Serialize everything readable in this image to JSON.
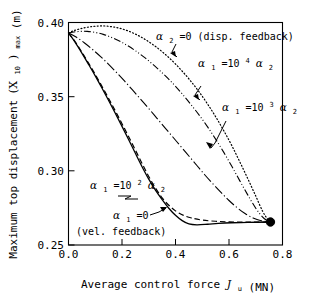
{
  "chart_data": {
    "type": "line",
    "title": "",
    "xlabel": "Average control force J_u (MN)",
    "ylabel": "Maximum top displacement  (X10)max  (m)",
    "xlim": [
      0.0,
      0.8
    ],
    "ylim": [
      0.25,
      0.4
    ],
    "xticks": [
      "0.0",
      "0.2",
      "0.4",
      "0.6",
      "0.8"
    ],
    "xtick_values": [
      0.0,
      0.2,
      0.4,
      0.6,
      0.8
    ],
    "yticks": [
      "0.25",
      "0.30",
      "0.35",
      "0.40"
    ],
    "ytick_values": [
      0.25,
      0.3,
      0.35,
      0.4
    ],
    "grid": false,
    "legend_position": "inline-annotations",
    "marker_endpoint": {
      "x": 0.755,
      "y": 0.2655,
      "style": "filled-circle"
    },
    "series": [
      {
        "name": "a2=0 (disp. feedback)",
        "style": "dotted",
        "points": [
          [
            0.0,
            0.393
          ],
          [
            0.02,
            0.3945
          ],
          [
            0.045,
            0.3958
          ],
          [
            0.07,
            0.3968
          ],
          [
            0.1,
            0.3975
          ],
          [
            0.13,
            0.3977
          ],
          [
            0.16,
            0.3972
          ],
          [
            0.19,
            0.3962
          ],
          [
            0.22,
            0.3945
          ],
          [
            0.25,
            0.3922
          ],
          [
            0.28,
            0.3893
          ],
          [
            0.31,
            0.3858
          ],
          [
            0.34,
            0.3818
          ],
          [
            0.37,
            0.3772
          ],
          [
            0.4,
            0.372
          ],
          [
            0.43,
            0.3662
          ],
          [
            0.46,
            0.3598
          ],
          [
            0.49,
            0.3528
          ],
          [
            0.52,
            0.345
          ],
          [
            0.55,
            0.3365
          ],
          [
            0.58,
            0.3272
          ],
          [
            0.61,
            0.3172
          ],
          [
            0.64,
            0.3062
          ],
          [
            0.67,
            0.2948
          ],
          [
            0.7,
            0.283
          ],
          [
            0.725,
            0.273
          ],
          [
            0.742,
            0.268
          ],
          [
            0.755,
            0.2655
          ]
        ]
      },
      {
        "name": "a1=10^4 a2",
        "style": "dash-dot-dot",
        "points": [
          [
            0.0,
            0.393
          ],
          [
            0.02,
            0.3936
          ],
          [
            0.045,
            0.394
          ],
          [
            0.07,
            0.394
          ],
          [
            0.1,
            0.3933
          ],
          [
            0.13,
            0.392
          ],
          [
            0.16,
            0.39
          ],
          [
            0.19,
            0.3875
          ],
          [
            0.22,
            0.3845
          ],
          [
            0.25,
            0.381
          ],
          [
            0.28,
            0.377
          ],
          [
            0.31,
            0.3726
          ],
          [
            0.34,
            0.3678
          ],
          [
            0.37,
            0.3626
          ],
          [
            0.4,
            0.357
          ],
          [
            0.43,
            0.3508
          ],
          [
            0.46,
            0.3442
          ],
          [
            0.49,
            0.3372
          ],
          [
            0.52,
            0.3296
          ],
          [
            0.55,
            0.3214
          ],
          [
            0.58,
            0.3126
          ],
          [
            0.61,
            0.3032
          ],
          [
            0.64,
            0.2934
          ],
          [
            0.67,
            0.2838
          ],
          [
            0.7,
            0.2748
          ],
          [
            0.725,
            0.269
          ],
          [
            0.742,
            0.2665
          ],
          [
            0.755,
            0.2655
          ]
        ]
      },
      {
        "name": "a1=10^3 a2",
        "style": "long-dash-dot",
        "points": [
          [
            0.0,
            0.393
          ],
          [
            0.03,
            0.39
          ],
          [
            0.06,
            0.3862
          ],
          [
            0.09,
            0.3818
          ],
          [
            0.12,
            0.377
          ],
          [
            0.15,
            0.3718
          ],
          [
            0.18,
            0.3662
          ],
          [
            0.21,
            0.3604
          ],
          [
            0.24,
            0.3544
          ],
          [
            0.27,
            0.3482
          ],
          [
            0.3,
            0.342
          ],
          [
            0.33,
            0.3356
          ],
          [
            0.36,
            0.3292
          ],
          [
            0.39,
            0.3228
          ],
          [
            0.42,
            0.3164
          ],
          [
            0.45,
            0.31
          ],
          [
            0.48,
            0.3036
          ],
          [
            0.51,
            0.2972
          ],
          [
            0.54,
            0.2912
          ],
          [
            0.57,
            0.2855
          ],
          [
            0.6,
            0.28
          ],
          [
            0.63,
            0.2752
          ],
          [
            0.66,
            0.2712
          ],
          [
            0.69,
            0.2682
          ],
          [
            0.72,
            0.2664
          ],
          [
            0.755,
            0.2655
          ]
        ]
      },
      {
        "name": "a1=10^2 a2",
        "style": "dashed",
        "points": [
          [
            0.0,
            0.393
          ],
          [
            0.025,
            0.387
          ],
          [
            0.05,
            0.38
          ],
          [
            0.075,
            0.3726
          ],
          [
            0.1,
            0.365
          ],
          [
            0.125,
            0.357
          ],
          [
            0.15,
            0.3488
          ],
          [
            0.175,
            0.3404
          ],
          [
            0.2,
            0.3318
          ],
          [
            0.225,
            0.323
          ],
          [
            0.25,
            0.314
          ],
          [
            0.275,
            0.305
          ],
          [
            0.3,
            0.2962
          ],
          [
            0.325,
            0.2884
          ],
          [
            0.35,
            0.2818
          ],
          [
            0.375,
            0.2768
          ],
          [
            0.4,
            0.273
          ],
          [
            0.43,
            0.27
          ],
          [
            0.46,
            0.2682
          ],
          [
            0.5,
            0.2668
          ],
          [
            0.55,
            0.266
          ],
          [
            0.6,
            0.2656
          ],
          [
            0.65,
            0.2654
          ],
          [
            0.7,
            0.2654
          ],
          [
            0.755,
            0.2655
          ]
        ]
      },
      {
        "name": "a1=0 (vel. feedback)",
        "style": "solid",
        "points": [
          [
            0.0,
            0.393
          ],
          [
            0.025,
            0.3866
          ],
          [
            0.05,
            0.3794
          ],
          [
            0.075,
            0.3718
          ],
          [
            0.1,
            0.364
          ],
          [
            0.125,
            0.3558
          ],
          [
            0.15,
            0.3474
          ],
          [
            0.175,
            0.3388
          ],
          [
            0.2,
            0.33
          ],
          [
            0.225,
            0.321
          ],
          [
            0.25,
            0.3118
          ],
          [
            0.275,
            0.3028
          ],
          [
            0.3,
            0.2944
          ],
          [
            0.325,
            0.287
          ],
          [
            0.35,
            0.2806
          ],
          [
            0.375,
            0.2748
          ],
          [
            0.4,
            0.27
          ],
          [
            0.425,
            0.2664
          ],
          [
            0.45,
            0.2642
          ],
          [
            0.48,
            0.2636
          ],
          [
            0.52,
            0.264
          ],
          [
            0.56,
            0.2646
          ],
          [
            0.61,
            0.265
          ],
          [
            0.67,
            0.2652
          ],
          [
            0.755,
            0.2655
          ]
        ]
      }
    ],
    "annotations": [
      {
        "id": "ann-a2-zero",
        "text": "a2=0 (disp. feedback)"
      },
      {
        "id": "ann-a1-10e4",
        "text": "a1=10^4 a2"
      },
      {
        "id": "ann-a1-10e3",
        "text": "a1=10^3 a2"
      },
      {
        "id": "ann-a1-10e2",
        "text": "a1=10^2 a2"
      },
      {
        "id": "ann-a1-zero",
        "text": "a1=0"
      },
      {
        "id": "ann-vel-fb",
        "text": "(vel. feedback)"
      }
    ]
  },
  "axes": {
    "x_title_main": "Average control force",
    "x_title_symbol": "J",
    "x_title_symbol_sub": "u",
    "x_title_unit": "(MN)",
    "y_title_main": "Maximum top displacement",
    "y_title_symbol_open": "(X",
    "y_title_symbol_sub": "10",
    "y_title_symbol_close": ")",
    "y_title_symbol_sub2": "max",
    "y_title_unit": "(m)"
  },
  "labels": {
    "x0": "0.0",
    "x1": "0.2",
    "x2": "0.4",
    "x3": "0.6",
    "x4": "0.8",
    "y0": "0.25",
    "y1": "0.30",
    "y2": "0.35",
    "y3": "0.40",
    "alpha": "α",
    "eq0": "=0",
    "eq10": "=10",
    "sub1": "1",
    "sub2": "2",
    "sup4": "4",
    "sup3": "3",
    "sup2": "2",
    "disp_fb": "(disp. feedback)",
    "vel_fb": "(vel. feedback)"
  },
  "colors": {
    "ink": "#000000",
    "background": "#ffffff"
  }
}
